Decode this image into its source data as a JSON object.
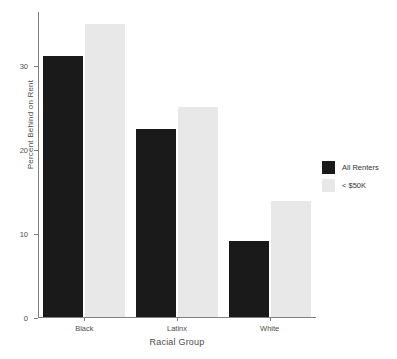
{
  "chart_data": {
    "type": "bar",
    "title": "",
    "xlabel": "Racial Group",
    "ylabel": "Percent Behind on Rent",
    "categories": [
      "Black",
      "Latinx",
      "White"
    ],
    "series": [
      {
        "name": "All Renters",
        "color": "#1a1a1a",
        "values": [
          31.3,
          22.5,
          9.2
        ]
      },
      {
        "name": "< $50K",
        "color": "#e8e8e8",
        "values": [
          35.1,
          25.2,
          13.9
        ]
      }
    ],
    "ylim": [
      0,
      36.5
    ],
    "yticks": [
      0,
      10,
      20,
      30
    ],
    "ytick_labels": [
      "0",
      "10",
      "20",
      "30"
    ],
    "grid": false,
    "legend_position": "right",
    "axis_color": "#808080",
    "text_color": "#4d4d4d"
  },
  "axes": {
    "y_title": "Percent Behind on Rent",
    "x_title": "Racial Group"
  },
  "legend": {
    "entries": [
      {
        "label": "All Renters"
      },
      {
        "label": "< $50K"
      }
    ]
  }
}
